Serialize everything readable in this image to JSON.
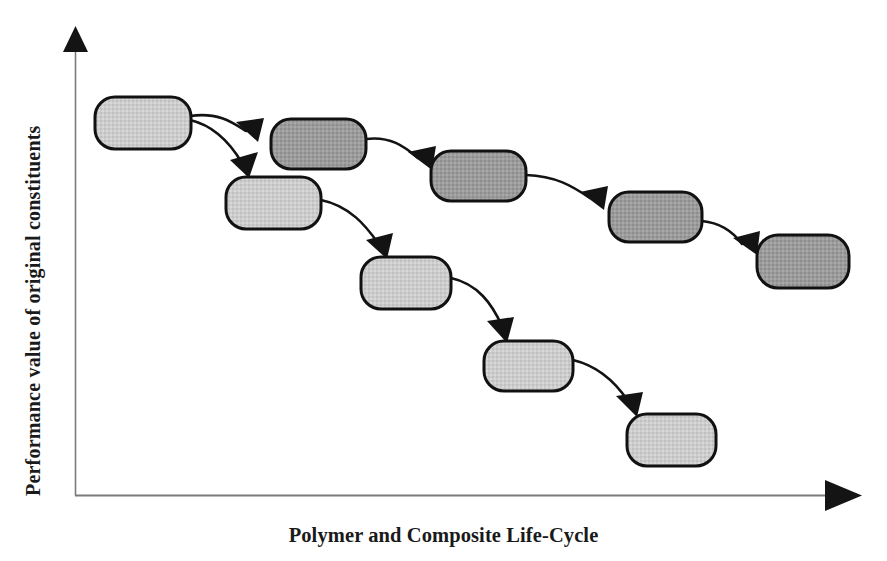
{
  "figure": {
    "kind": "conceptual-cascade-diagram",
    "background_color": "#ffffff",
    "axes": {
      "y_label": "Performance value of original constituents",
      "x_label": "Polymer and Composite Life-Cycle",
      "axis_line_color": "#7a7a7a",
      "arrowhead_color": "#111111",
      "origin": {
        "x": 75,
        "y": 495
      },
      "y_axis_top": {
        "x": 75,
        "y": 30
      },
      "x_axis_right": {
        "x": 860,
        "y": 495
      }
    },
    "palette": {
      "light_fill": "#cccccc",
      "dark_fill": "#999999",
      "outline": "#111111",
      "arrow": "#111111",
      "text": "#1a1a1a"
    },
    "nodes": [
      {
        "id": "n1",
        "shade": "light",
        "x": 95,
        "y": 97,
        "w": 96,
        "h": 52,
        "label": ""
      },
      {
        "id": "n2",
        "shade": "dark",
        "x": 271,
        "y": 119,
        "w": 95,
        "h": 50,
        "label": ""
      },
      {
        "id": "n3",
        "shade": "dark",
        "x": 431,
        "y": 151,
        "w": 95,
        "h": 50,
        "label": ""
      },
      {
        "id": "n4",
        "shade": "dark",
        "x": 609,
        "y": 192,
        "w": 93,
        "h": 50,
        "label": ""
      },
      {
        "id": "n5",
        "shade": "dark",
        "x": 757,
        "y": 235,
        "w": 92,
        "h": 53,
        "label": ""
      },
      {
        "id": "n6",
        "shade": "light",
        "x": 226,
        "y": 177,
        "w": 95,
        "h": 52,
        "label": ""
      },
      {
        "id": "n7",
        "shade": "light",
        "x": 361,
        "y": 257,
        "w": 90,
        "h": 52,
        "label": ""
      },
      {
        "id": "n8",
        "shade": "light",
        "x": 484,
        "y": 341,
        "w": 89,
        "h": 50,
        "label": ""
      },
      {
        "id": "n9",
        "shade": "light",
        "x": 627,
        "y": 414,
        "w": 89,
        "h": 52,
        "label": ""
      }
    ],
    "connections": [
      {
        "from": "n1",
        "to": "n2",
        "type": "curved-arrow"
      },
      {
        "from": "n1",
        "to": "n6",
        "type": "curved-arrow"
      },
      {
        "from": "n2",
        "to": "n3",
        "type": "curved-arrow"
      },
      {
        "from": "n3",
        "to": "n4",
        "type": "curved-arrow"
      },
      {
        "from": "n4",
        "to": "n5",
        "type": "curved-arrow"
      },
      {
        "from": "n6",
        "to": "n7",
        "type": "curved-arrow"
      },
      {
        "from": "n7",
        "to": "n8",
        "type": "curved-arrow"
      },
      {
        "from": "n8",
        "to": "n9",
        "type": "curved-arrow"
      }
    ]
  }
}
